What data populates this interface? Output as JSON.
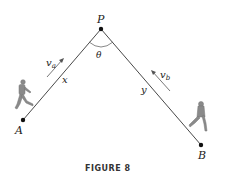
{
  "figure": {
    "caption": "FIGURE 8",
    "points": {
      "P": {
        "label": "P",
        "x": 101,
        "y": 29
      },
      "A": {
        "label": "A",
        "x": 23,
        "y": 120
      },
      "B": {
        "label": "B",
        "x": 201,
        "y": 145
      }
    },
    "angle_label": "θ",
    "segments": {
      "AP": {
        "label": "x"
      },
      "PB": {
        "label": "y"
      }
    },
    "velocities": {
      "a": {
        "label": "v",
        "subscript": "a"
      },
      "b": {
        "label": "v",
        "subscript": "b"
      }
    },
    "colors": {
      "line": "#333333",
      "point": "#111111",
      "arrow": "#555555",
      "figure_person": "#8a8a8a"
    }
  }
}
